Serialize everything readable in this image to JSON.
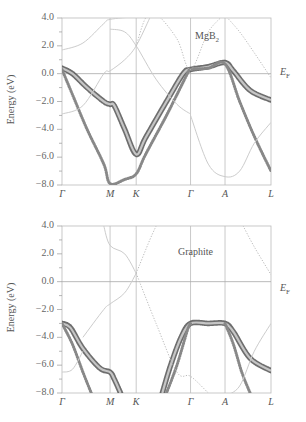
{
  "chart_data": [
    {
      "type": "line",
      "title": "MgB2",
      "material_label": "MgB",
      "material_sub": "2",
      "xlabel": "",
      "ylabel": "Energy (eV)",
      "ylim": [
        -8.0,
        4.0
      ],
      "yticks": [
        "4.0",
        "2.0",
        "0.0",
        "−2.0",
        "−4.0",
        "−6.0",
        "−8.0"
      ],
      "ytick_values": [
        4,
        2,
        0,
        -2,
        -4,
        -6,
        -8
      ],
      "kpoints": [
        "Γ",
        "M",
        "K",
        "Γ",
        "A",
        "L"
      ],
      "kpoint_positions": [
        0,
        0.23,
        0.355,
        0.615,
        0.78,
        1.0
      ],
      "fermi_label": "E",
      "fermi_sub": "F",
      "grid": "vertical lines at k-points, horizontal at E_F",
      "series": [
        {
          "name": "sigma band (heavy)",
          "style": "circles-heavy",
          "x": [
            0,
            0.05,
            0.12,
            0.2,
            0.23,
            0.25,
            0.3,
            0.355,
            0.4,
            0.5,
            0.58,
            0.615,
            0.7,
            0.78,
            0.82,
            0.9,
            1.0
          ],
          "y": [
            0.4,
            0.0,
            -1.0,
            -2.0,
            -2.2,
            -2.3,
            -4.0,
            -5.8,
            -4.6,
            -2.0,
            0.0,
            0.3,
            0.5,
            0.8,
            0.2,
            -1.2,
            -1.9
          ]
        },
        {
          "name": "sigma band 2",
          "style": "circles-light",
          "x": [
            0,
            0.05,
            0.12,
            0.2,
            0.23,
            0.3,
            0.355,
            0.4,
            0.5,
            0.6,
            0.615,
            0.7,
            0.78,
            0.85,
            0.92,
            1.0
          ],
          "y": [
            0.3,
            -1.5,
            -4.0,
            -6.5,
            -7.9,
            -7.6,
            -7.2,
            -5.8,
            -3.0,
            0.0,
            0.3,
            0.4,
            0.7,
            -2.0,
            -4.5,
            -7.0
          ]
        },
        {
          "name": "pi band upper",
          "style": "thin",
          "x": [
            0,
            0.1,
            0.2,
            0.23,
            0.355,
            0.45,
            0.5
          ],
          "y": [
            1.7,
            2.2,
            3.6,
            3.9,
            4.1,
            4.2,
            4.3
          ]
        },
        {
          "name": "pi band mid",
          "style": "thin",
          "x": [
            0.23,
            0.3,
            0.355,
            0.45,
            0.55,
            0.615
          ],
          "y": [
            3.2,
            3.0,
            2.0,
            -0.4,
            -2.2,
            -2.9
          ]
        },
        {
          "name": "pi band lower",
          "style": "thin",
          "x": [
            0,
            0.1,
            0.2,
            0.23,
            0.3,
            0.355,
            0.42
          ],
          "y": [
            -2.9,
            -2.3,
            0.0,
            0.2,
            1.0,
            2.0,
            4.0
          ]
        },
        {
          "name": "pi band A-L",
          "style": "thin",
          "x": [
            0.615,
            0.7,
            0.78,
            0.85,
            0.92,
            1.0
          ],
          "y": [
            -3.0,
            -6.5,
            -7.4,
            -7.0,
            -5.0,
            -3.5
          ]
        },
        {
          "name": "dotted upper",
          "style": "dotted",
          "x": [
            0.355,
            0.4,
            0.45,
            0.55,
            0.615,
            0.7,
            0.78
          ],
          "y": [
            2.0,
            4.0,
            4.3,
            2.5,
            0.3,
            3.0,
            4.3
          ]
        },
        {
          "name": "dotted A-L",
          "style": "dotted",
          "x": [
            0.78,
            0.85,
            0.92,
            1.0
          ],
          "y": [
            4.2,
            3.0,
            1.5,
            -0.3
          ]
        }
      ]
    },
    {
      "type": "line",
      "title": "Graphite",
      "material_label": "Graphite",
      "xlabel": "",
      "ylabel": "Energy (eV)",
      "ylim": [
        -8.0,
        4.0
      ],
      "yticks": [
        "4.0",
        "2.0",
        "0.0",
        "−2.0",
        "−4.0",
        "−6.0",
        "−8.0"
      ],
      "ytick_values": [
        4,
        2,
        0,
        -2,
        -4,
        -6,
        -8
      ],
      "kpoints": [
        "Γ",
        "M",
        "K",
        "Γ",
        "A",
        "L"
      ],
      "kpoint_positions": [
        0,
        0.23,
        0.355,
        0.615,
        0.78,
        1.0
      ],
      "fermi_label": "E",
      "fermi_sub": "F",
      "grid": "vertical lines at k-points, horizontal at E_F",
      "series": [
        {
          "name": "sigma band (heavy)",
          "style": "circles-heavy",
          "x": [
            0,
            0.04,
            0.1,
            0.18,
            0.23,
            0.25,
            0.28
          ],
          "y": [
            -3.0,
            -3.3,
            -4.8,
            -6.2,
            -6.5,
            -7.0,
            -8.0
          ]
        },
        {
          "name": "sigma band 2",
          "style": "circles-light",
          "x": [
            0,
            0.05,
            0.1,
            0.14
          ],
          "y": [
            -3.0,
            -4.5,
            -6.5,
            -8.0
          ]
        },
        {
          "name": "sigma rising",
          "style": "circles-heavy",
          "x": [
            0.48,
            0.52,
            0.57,
            0.615,
            0.7,
            0.78,
            0.82,
            0.9,
            1.0
          ],
          "y": [
            -8.0,
            -6.0,
            -4.0,
            -3.0,
            -3.0,
            -3.0,
            -3.6,
            -5.5,
            -6.4
          ]
        },
        {
          "name": "sigma rising 2",
          "style": "circles-light",
          "x": [
            0.5,
            0.55,
            0.6,
            0.615
          ],
          "y": [
            -8.0,
            -6.0,
            -3.5,
            -3.0
          ]
        },
        {
          "name": "sigma falling 2",
          "style": "circles-light",
          "x": [
            0.78,
            0.82,
            0.86,
            0.9
          ],
          "y": [
            -3.0,
            -4.5,
            -6.5,
            -8.0
          ]
        },
        {
          "name": "pi band upper",
          "style": "thin",
          "x": [
            0.2,
            0.23,
            0.3,
            0.355
          ],
          "y": [
            4.0,
            2.6,
            2.0,
            0.6
          ]
        },
        {
          "name": "pi band lower",
          "style": "thin",
          "x": [
            0.1,
            0.2,
            0.23,
            0.3,
            0.355
          ],
          "y": [
            -4.0,
            -2.0,
            -1.6,
            -0.8,
            0.6
          ]
        },
        {
          "name": "pi dotted",
          "style": "dotted",
          "x": [
            0.355,
            0.45,
            0.55,
            0.615,
            0.7
          ],
          "y": [
            0.6,
            -3.0,
            -6.5,
            -6.8,
            -8.0
          ]
        },
        {
          "name": "pi dotted up",
          "style": "dotted",
          "x": [
            0.355,
            0.42,
            0.46
          ],
          "y": [
            0.6,
            3.0,
            4.3
          ]
        },
        {
          "name": "pi Gamma-left",
          "style": "thin",
          "x": [
            0,
            0.05,
            0.1
          ],
          "y": [
            -6.5,
            -6.3,
            -5.0
          ]
        },
        {
          "name": "pi A-L dotted",
          "style": "dotted",
          "x": [
            0.86,
            0.92,
            1.0
          ],
          "y": [
            4.2,
            2.5,
            0.5
          ]
        },
        {
          "name": "pi A-L lower",
          "style": "thin",
          "x": [
            0.78,
            0.85,
            0.92,
            1.0
          ],
          "y": [
            -8.2,
            -7.5,
            -5.0,
            -3.0
          ]
        }
      ]
    }
  ]
}
